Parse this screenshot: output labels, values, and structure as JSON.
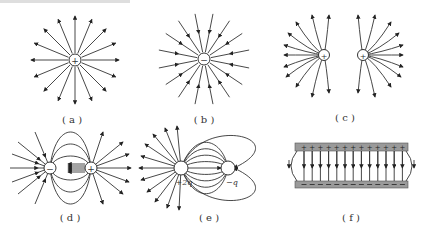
{
  "figure": {
    "panels": [
      {
        "id": "a",
        "caption": "( a )",
        "description": "Isolated positive point charge, field lines radiate outward",
        "charge": "+"
      },
      {
        "id": "b",
        "caption": "( b )",
        "description": "Isolated negative point charge, field lines point inward",
        "charge": "−"
      },
      {
        "id": "c",
        "caption": "( c )",
        "description": "Two equal positive charges, field lines repel",
        "charges": [
          "+",
          "+"
        ]
      },
      {
        "id": "d",
        "caption": "( d )",
        "description": "Electric dipole: negative and positive charges",
        "charges": [
          "−",
          "+"
        ]
      },
      {
        "id": "e",
        "caption": "( e )",
        "description": "Unequal charges +2q and −q",
        "charges": [
          "+2q",
          "−q"
        ]
      },
      {
        "id": "f",
        "caption": "( f )",
        "description": "Parallel plates: positive top plate, negative bottom plate, uniform field downward",
        "top_plate": "+ + + + + + + + + + + + + +",
        "bottom_plate": "— — — — — — — — — — — — — —"
      }
    ],
    "colors": {
      "line": "#333333",
      "plate": "#9a9a9a"
    }
  }
}
